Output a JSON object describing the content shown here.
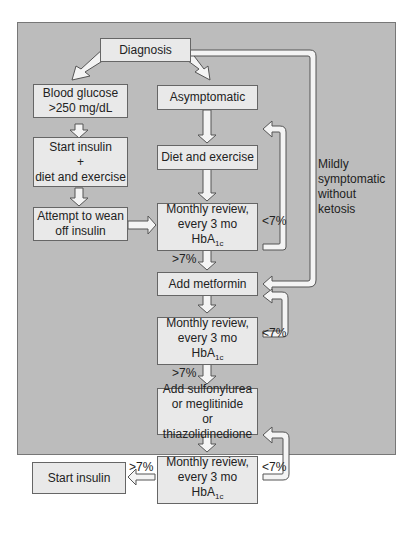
{
  "diagram": {
    "nodes": {
      "diagnosis": "Diagnosis",
      "blood_glucose": "Blood glucose\n>250 mg/dL",
      "asymptomatic": "Asymptomatic",
      "start_insulin_diet": "Start insulin\n+\ndiet and exercise",
      "diet_exercise": "Diet and exercise",
      "wean_insulin": "Attempt to wean\noff insulin",
      "review1_line1": "Monthly review,",
      "review1_line2": "every 3 mo",
      "add_metformin": "Add metformin",
      "review2_line1": "Monthly review,",
      "review2_line2": "every 3 mo",
      "add_sulfonylurea": "Add sulfonylurea\nor meglitinide\nor thiazolidinedione",
      "review3_line1": "Monthly review,",
      "review3_line2": "every 3 mo",
      "start_insulin": "Start insulin"
    },
    "hba": {
      "base": "HbA",
      "sub": "1c"
    },
    "labels": {
      "lt7_1": "<7%",
      "gt7_1": ">7%",
      "lt7_2": "<7%",
      "gt7_2": ">7%",
      "lt7_3": "<7%",
      "gt7_3": ">7%",
      "mild": "Mildly\nsymptomatic\nwithout\nketosis"
    },
    "colors": {
      "panel": "#bcbcbc",
      "box": "#e9e9e9",
      "arrow": "#f4f4f4"
    }
  }
}
